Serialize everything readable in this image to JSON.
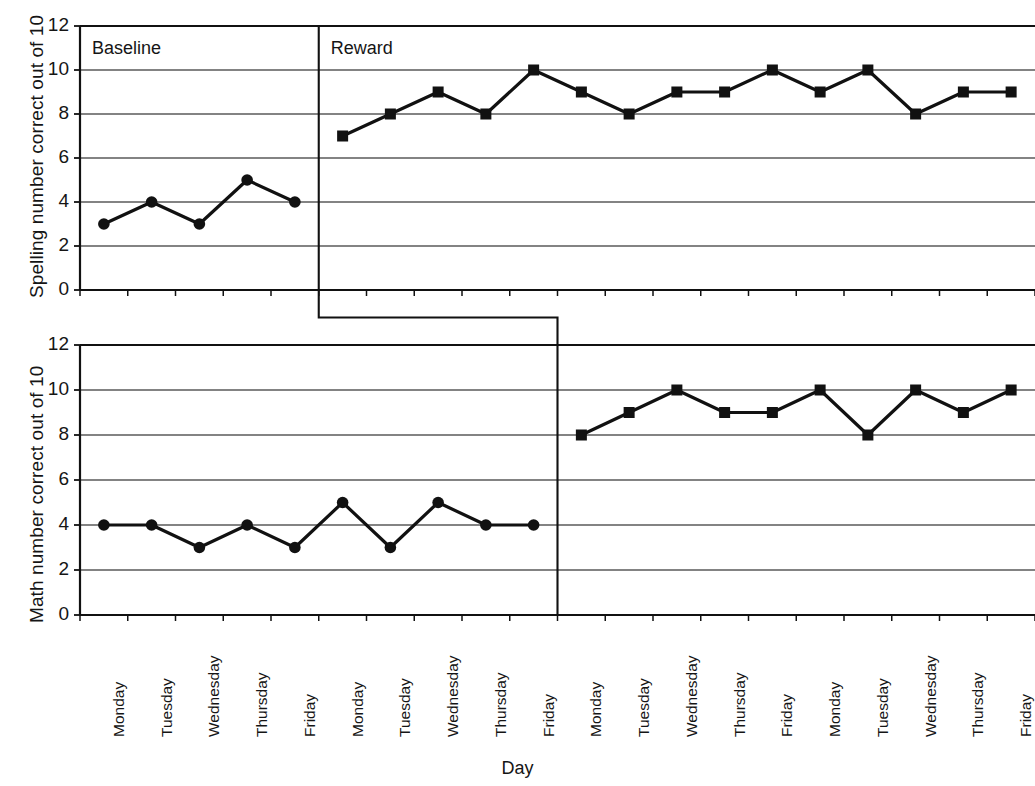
{
  "figure": {
    "xlabel": "Day",
    "background": "#ffffff",
    "line_color": "#111111",
    "grid_color": "#5a5a5a",
    "axis_color": "#111111"
  },
  "panels": [
    {
      "id": "spelling",
      "ylabel": "Spelling number correct out of 10",
      "ylim": [
        0,
        12
      ],
      "yticks": [
        0,
        2,
        4,
        6,
        8,
        10,
        12
      ],
      "phase_labels": [
        {
          "text": "Baseline",
          "at_index": 0
        },
        {
          "text": "Reward",
          "at_index": 5
        }
      ],
      "phase_change_index": 5,
      "series": [
        {
          "name": "Baseline",
          "marker": "circle",
          "x_index": [
            0,
            1,
            2,
            3,
            4
          ],
          "values": [
            3,
            4,
            3,
            5,
            4
          ]
        },
        {
          "name": "Reward",
          "marker": "square",
          "x_index": [
            5,
            6,
            7,
            8,
            9,
            10,
            11,
            12,
            13,
            14,
            15,
            16,
            17,
            18,
            19
          ],
          "values": [
            7,
            8,
            9,
            8,
            10,
            9,
            8,
            9,
            9,
            10,
            9,
            10,
            8,
            9,
            9
          ]
        }
      ]
    },
    {
      "id": "math",
      "ylabel": "Math number correct out of 10",
      "ylim": [
        0,
        12
      ],
      "yticks": [
        0,
        2,
        4,
        6,
        8,
        10,
        12
      ],
      "phase_labels": [],
      "phase_change_index": 10,
      "series": [
        {
          "name": "Baseline",
          "marker": "circle",
          "x_index": [
            0,
            1,
            2,
            3,
            4,
            5,
            6,
            7,
            8,
            9
          ],
          "values": [
            4,
            4,
            3,
            4,
            3,
            5,
            3,
            5,
            4,
            4
          ]
        },
        {
          "name": "Reward",
          "marker": "square",
          "x_index": [
            10,
            11,
            12,
            13,
            14,
            15,
            16,
            17,
            18,
            19
          ],
          "values": [
            8,
            9,
            10,
            9,
            9,
            10,
            8,
            10,
            9,
            10
          ]
        }
      ]
    }
  ],
  "x_categories": [
    "Monday",
    "Tuesday",
    "Wednesday",
    "Thursday",
    "Friday",
    "Monday",
    "Tuesday",
    "Wednesday",
    "Thursday",
    "Friday",
    "Monday",
    "Tuesday",
    "Wednesday",
    "Thursday",
    "Friday",
    "Monday",
    "Tuesday",
    "Wednesday",
    "Thursday",
    "Friday"
  ],
  "chart_data": {
    "type": "line",
    "title": "",
    "subtitle": "",
    "xlabel": "Day",
    "grid": true,
    "legend": "none",
    "design": "multiple-baseline ABAB single-subject design",
    "categories": [
      "Monday",
      "Tuesday",
      "Wednesday",
      "Thursday",
      "Friday",
      "Monday",
      "Tuesday",
      "Wednesday",
      "Thursday",
      "Friday",
      "Monday",
      "Tuesday",
      "Wednesday",
      "Thursday",
      "Friday",
      "Monday",
      "Tuesday",
      "Wednesday",
      "Thursday",
      "Friday"
    ],
    "panels": [
      {
        "ylabel": "Spelling number correct out of 10",
        "ylim": [
          0,
          12
        ],
        "yticks": [
          0,
          2,
          4,
          6,
          8,
          10,
          12
        ],
        "phase_change_after_index": 4,
        "annotations": [
          "Baseline",
          "Reward"
        ],
        "series": [
          {
            "name": "Baseline",
            "marker": "circle",
            "values": [
              3,
              4,
              3,
              5,
              4
            ]
          },
          {
            "name": "Reward",
            "marker": "square",
            "values": [
              7,
              8,
              9,
              8,
              10,
              9,
              8,
              9,
              9,
              10,
              9,
              10,
              8,
              9,
              9
            ]
          }
        ],
        "all_values": [
          3,
          4,
          3,
          5,
          4,
          7,
          8,
          9,
          8,
          10,
          9,
          8,
          9,
          9,
          10,
          9,
          10,
          8,
          9,
          9
        ]
      },
      {
        "ylabel": "Math number correct out of 10",
        "ylim": [
          0,
          12
        ],
        "yticks": [
          0,
          2,
          4,
          6,
          8,
          10,
          12
        ],
        "phase_change_after_index": 9,
        "annotations": [],
        "series": [
          {
            "name": "Baseline",
            "marker": "circle",
            "values": [
              4,
              4,
              3,
              4,
              3,
              5,
              3,
              5,
              4,
              4
            ]
          },
          {
            "name": "Reward",
            "marker": "square",
            "values": [
              8,
              9,
              10,
              9,
              9,
              10,
              8,
              10,
              9,
              10
            ]
          }
        ],
        "all_values": [
          4,
          4,
          3,
          4,
          3,
          5,
          3,
          5,
          4,
          4,
          8,
          9,
          10,
          9,
          9,
          10,
          8,
          10,
          9,
          10
        ]
      }
    ]
  }
}
